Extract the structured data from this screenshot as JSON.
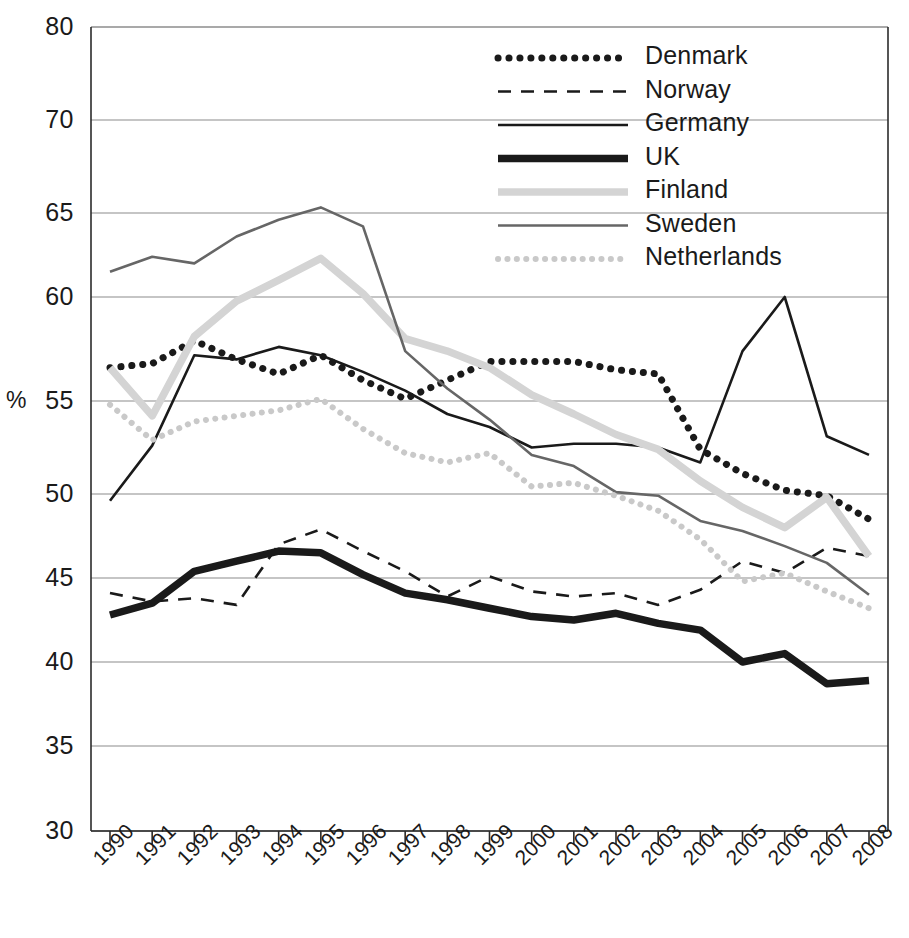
{
  "chart_data": {
    "type": "line",
    "title": "",
    "subtitle": "",
    "xlabel": "",
    "ylabel": "%",
    "grid": true,
    "legend_position": "top-right",
    "x": [
      "1990",
      "1991",
      "1992",
      "1993",
      "1994",
      "1995",
      "1996",
      "1997",
      "1998",
      "1999",
      "2000",
      "2001",
      "2002",
      "2003",
      "2004",
      "2005",
      "2006",
      "2007",
      "2008"
    ],
    "categories": [
      "1990",
      "1991",
      "1992",
      "1993",
      "1994",
      "1995",
      "1996",
      "1997",
      "1998",
      "1999",
      "2000",
      "2001",
      "2002",
      "2003",
      "2004",
      "2005",
      "2006",
      "2007",
      "2008"
    ],
    "ytick_labels": [
      "80",
      "70",
      "65",
      "60",
      "55",
      "50",
      "45",
      "40",
      "35",
      "30"
    ],
    "ytick_values": [
      80,
      70,
      65,
      60,
      55,
      50,
      45,
      40,
      35,
      30
    ],
    "ylim": [
      30,
      80
    ],
    "axis_note": "y axis compressed between 70 and 80 (same pixel gap as 5-unit steps below 70)",
    "series": [
      {
        "name": "Denmark",
        "style": "dotted",
        "color": "#1a1a1a",
        "width": 7,
        "values": [
          56.6,
          56.8,
          57.9,
          57.0,
          56.3,
          57.2,
          56.0,
          55.1,
          56.0,
          56.9,
          56.9,
          56.9,
          56.5,
          56.3,
          52.4,
          51.1,
          50.2,
          49.9,
          48.5
        ]
      },
      {
        "name": "Norway",
        "style": "dashed",
        "color": "#1a1a1a",
        "width": 2.6,
        "values": [
          44.1,
          43.6,
          43.8,
          43.4,
          47.0,
          47.9,
          46.6,
          45.4,
          43.9,
          45.1,
          44.2,
          43.9,
          44.1,
          43.4,
          44.3,
          46.0,
          45.3,
          46.8,
          46.3
        ]
      },
      {
        "name": "Germany",
        "style": "solid",
        "color": "#1a1a1a",
        "width": 2.6,
        "values": [
          49.6,
          52.6,
          57.2,
          57.0,
          57.6,
          57.2,
          56.4,
          55.5,
          54.3,
          53.6,
          52.5,
          52.7,
          52.7,
          52.5,
          51.7,
          57.4,
          60.0,
          53.1,
          52.1
        ]
      },
      {
        "name": "UK",
        "style": "solid",
        "color": "#1a1a1a",
        "width": 7.5,
        "values": [
          42.8,
          43.5,
          45.4,
          46.0,
          46.6,
          46.5,
          45.2,
          44.1,
          43.7,
          43.2,
          42.7,
          42.5,
          42.9,
          42.3,
          41.9,
          40.0,
          40.5,
          38.7,
          38.9
        ]
      },
      {
        "name": "Finland",
        "style": "solid",
        "color": "#d4d4d4",
        "width": 7.5,
        "values": [
          56.6,
          54.2,
          58.1,
          59.8,
          61.0,
          62.3,
          60.2,
          58.0,
          57.4,
          56.6,
          55.3,
          54.3,
          53.2,
          52.4,
          50.7,
          49.2,
          48.0,
          49.8,
          46.3
        ]
      },
      {
        "name": "Sweden",
        "style": "solid",
        "color": "#666666",
        "width": 2.6,
        "values": [
          61.5,
          62.4,
          62.0,
          63.6,
          64.6,
          65.3,
          64.2,
          57.4,
          55.6,
          54.0,
          52.1,
          51.5,
          50.1,
          49.9,
          48.4,
          47.8,
          46.9,
          45.9,
          44.0
        ]
      },
      {
        "name": "Netherlands",
        "style": "dotted",
        "color": "#c9c9c9",
        "width": 6,
        "values": [
          54.8,
          52.9,
          53.9,
          54.2,
          54.5,
          55.1,
          53.5,
          52.2,
          51.7,
          52.2,
          50.4,
          50.6,
          49.9,
          49.0,
          47.3,
          44.8,
          45.3,
          44.2,
          43.2
        ]
      }
    ]
  },
  "legend": {
    "items": [
      {
        "label": "Denmark"
      },
      {
        "label": "Norway"
      },
      {
        "label": "Germany"
      },
      {
        "label": "UK"
      },
      {
        "label": "Finland"
      },
      {
        "label": "Sweden"
      },
      {
        "label": "Netherlands"
      }
    ]
  },
  "axis": {
    "y_unit_label": "%"
  }
}
